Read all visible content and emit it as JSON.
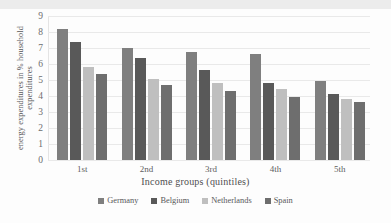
{
  "chart_data": {
    "type": "bar",
    "title": "",
    "subtitle": "",
    "xlabel": "Income groups (quintiles)",
    "ylabel_line1": "energy expenditures in % household",
    "ylabel_line2": "expenditures",
    "categories": [
      "1st",
      "2nd",
      "3rd",
      "4th",
      "5th"
    ],
    "series": [
      {
        "name": "Germany",
        "color": "#7f7f7f",
        "values": [
          8.2,
          7.0,
          6.75,
          6.6,
          4.95
        ]
      },
      {
        "name": "Belgium",
        "color": "#595959",
        "values": [
          7.4,
          6.35,
          5.65,
          4.8,
          4.1
        ]
      },
      {
        "name": "Netherlands",
        "color": "#bfbfbf",
        "values": [
          5.8,
          5.05,
          4.8,
          4.45,
          3.8
        ]
      },
      {
        "name": "Spain",
        "color": "#6e6e6e",
        "values": [
          5.35,
          4.7,
          4.3,
          3.95,
          3.6
        ]
      }
    ],
    "yticks": [
      0,
      1,
      2,
      3,
      4,
      5,
      6,
      7,
      8,
      9
    ],
    "ylim": [
      0,
      9
    ],
    "grid": true,
    "legend_position": "bottom"
  }
}
